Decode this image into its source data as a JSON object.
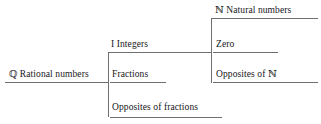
{
  "diagram": {
    "type": "tree-classification-of-rational-numbers",
    "title": "",
    "colors": {
      "line": "#6f6f6f",
      "text": "#16161a",
      "background": "#ffffff"
    },
    "nodes": {
      "rational": {
        "symbol": "ℚ",
        "label": "Rational numbers",
        "full": "ℚ Rational numbers"
      },
      "integers": {
        "symbol": "I",
        "label": "Integers",
        "full": "I Integers"
      },
      "fractions": {
        "symbol": "",
        "label": "Fractions",
        "full": "Fractions"
      },
      "opposites_of_fractions": {
        "symbol": "",
        "label": "Opposites of fractions",
        "full": "Opposites of fractions"
      },
      "natural": {
        "symbol": "ℕ",
        "label": "Natural numbers",
        "full": "ℕ Natural numbers"
      },
      "zero": {
        "symbol": "",
        "label": "Zero",
        "full": "Zero"
      },
      "opposites_of_natural": {
        "symbol": "",
        "label": "Opposites of ℕ",
        "full": "Opposites of ℕ"
      }
    }
  }
}
